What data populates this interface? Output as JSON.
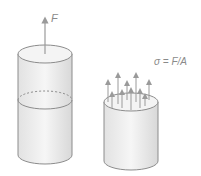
{
  "diagram": {
    "left_cylinder": {
      "force_label": "F"
    },
    "right_cylinder": {
      "formula": "σ = F/A"
    },
    "colors": {
      "outline": "#8c8c8c",
      "fill_light": "#f2f2f2",
      "fill_dark": "#d4d4d4",
      "text": "#8a8a8a"
    }
  }
}
